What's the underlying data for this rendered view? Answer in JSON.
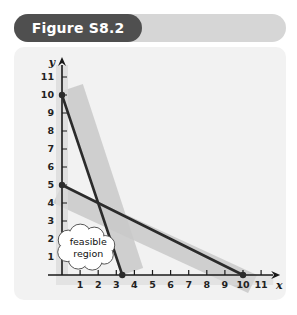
{
  "header": {
    "title": "Figure S8.2",
    "tab_color": "#4f4f4f",
    "bar_color": "#d6d6d6"
  },
  "panel": {
    "background": "#f2f2f2"
  },
  "callout": {
    "line1": "feasible",
    "line2": "region"
  },
  "chart_data": {
    "type": "line",
    "title": "Figure S8.2",
    "xlabel": "x",
    "ylabel": "y",
    "xlim": [
      0,
      12
    ],
    "ylim": [
      0,
      12
    ],
    "grid": false,
    "legend": null,
    "x_ticks": [
      1,
      2,
      3,
      4,
      5,
      6,
      7,
      8,
      9,
      10,
      11
    ],
    "y_ticks": [
      1,
      2,
      3,
      4,
      5,
      6,
      7,
      8,
      9,
      10,
      11
    ],
    "series": [
      {
        "name": "steep-constraint-line",
        "color": "#2b2b2b",
        "points": [
          [
            0,
            10
          ],
          [
            3.33,
            0
          ]
        ],
        "endpoint_markers": [
          [
            0,
            10
          ],
          [
            3.33,
            0
          ]
        ],
        "shaded_side": "right",
        "shade_color": "#c9c9c9"
      },
      {
        "name": "shallow-constraint-line",
        "color": "#2b2b2b",
        "points": [
          [
            0,
            5
          ],
          [
            10,
            0
          ]
        ],
        "endpoint_markers": [
          [
            0,
            5
          ],
          [
            10,
            0
          ]
        ],
        "shaded_side": "above",
        "shade_color": "#c9c9c9"
      }
    ],
    "annotations": [
      {
        "name": "feasible-region-callout",
        "text": "feasible region",
        "x": 1.45,
        "y": 1.55
      }
    ],
    "intersection": [
      2,
      4
    ]
  }
}
